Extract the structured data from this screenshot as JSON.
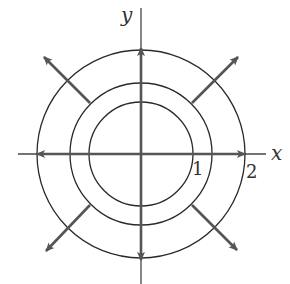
{
  "diagram": {
    "type": "vector-field-with-level-curves",
    "center": [
      141,
      154
    ],
    "axes": {
      "x_label": "x",
      "y_label": "y",
      "x_range_px": [
        18,
        266
      ],
      "y_range_px": [
        8,
        284
      ]
    },
    "circles": [
      {
        "name": "inner",
        "r": 52
      },
      {
        "name": "middle",
        "r": 71
      },
      {
        "name": "outer",
        "r": 104
      }
    ],
    "tick_labels": [
      {
        "text": "1",
        "x": 197,
        "y": 175
      },
      {
        "text": "2",
        "x": 245,
        "y": 178
      }
    ],
    "cardinal_arrows": [
      {
        "dir": "up",
        "from_r": 0,
        "to_r": 106
      },
      {
        "dir": "down",
        "from_r": 0,
        "to_r": 106
      },
      {
        "dir": "left",
        "from_r": 0,
        "to_r": 104
      },
      {
        "dir": "right",
        "from_r": 0,
        "to_r": 104
      }
    ],
    "diagonal_arrows": [
      {
        "dir": "up-left",
        "angle": 225,
        "from_r": 72,
        "to_r": 137
      },
      {
        "dir": "up-right",
        "angle": 315,
        "from_r": 72,
        "to_r": 137
      },
      {
        "dir": "down-left",
        "angle": 135,
        "from_r": 72,
        "to_r": 137
      },
      {
        "dir": "down-right",
        "angle": 45,
        "from_r": 72,
        "to_r": 137
      }
    ],
    "colors": {
      "circle": "#2a2a2a",
      "axis": "#444444",
      "arrow": "#555555"
    }
  }
}
